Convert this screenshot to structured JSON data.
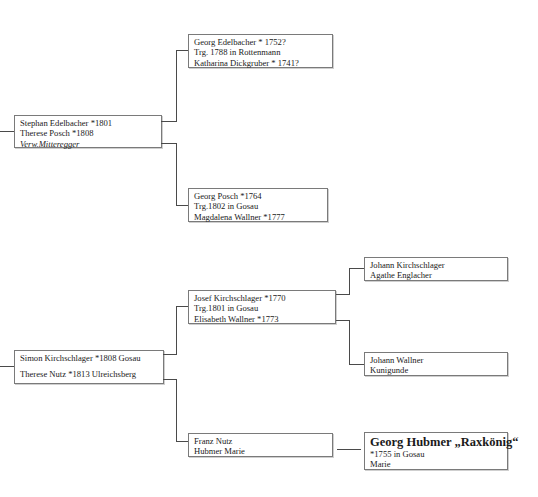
{
  "tree_1": {
    "root": {
      "lines": [
        "Stephan Edelbacher *1801",
        "Therese Posch *1808",
        "Verw.Mitteregger"
      ]
    },
    "father_parents": {
      "lines": [
        "Georg Edelbacher * 1752?",
        "Trg. 1788 in Rottenmann",
        "Katharina Dickgruber * 1741?"
      ]
    },
    "mother_parents": {
      "lines": [
        "Georg Posch  *1764",
        "Trg.1802 in Gosau",
        "Magdalena Wallner *1777"
      ]
    }
  },
  "tree_2": {
    "root": {
      "lines": [
        "Simon Kirchschlager *1808 Gosau",
        "Therese Nutz *1813 Ulreichsberg"
      ]
    },
    "father_parents": {
      "lines": [
        "Josef Kirchschlager *1770",
        "Trg.1801 in Gosau",
        "Elisabeth Wallner *1773"
      ]
    },
    "mother_parents": {
      "lines": [
        "Franz Nutz",
        "Hubmer Marie"
      ]
    },
    "grandparents_kirchschlager": {
      "lines": [
        "Johann Kirchschlager",
        "Agathe Englacher"
      ]
    },
    "grandparents_wallner": {
      "lines": [
        "Johann Wallner",
        "Kunigunde"
      ]
    },
    "grandparents_hubmer": {
      "title": "Georg Hubmer  „Raxkönig“",
      "lines": [
        "*1755 in Gosau",
        "Marie"
      ]
    }
  }
}
